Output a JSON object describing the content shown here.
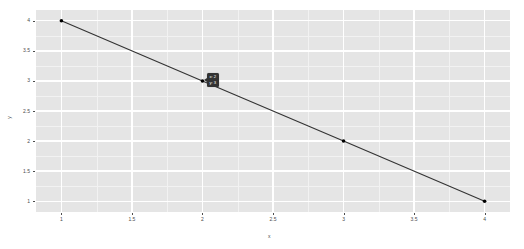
{
  "chart_data": {
    "type": "line",
    "title": "",
    "subtitle": "",
    "xlabel": "x",
    "ylabel": "y",
    "x": [
      1,
      2,
      3,
      4
    ],
    "values": [
      4,
      3,
      2,
      1
    ],
    "series": [
      {
        "name": "",
        "values": [
          4,
          3,
          2,
          1
        ]
      }
    ],
    "xlim": [
      0.82,
      4.18
    ],
    "ylim": [
      0.82,
      4.18
    ],
    "x_ticks": [
      1,
      1.5,
      2,
      2.5,
      3,
      3.5,
      4
    ],
    "x_tick_labels": [
      "1",
      "1.5",
      "2",
      "2.5",
      "3",
      "3.5",
      "4"
    ],
    "y_ticks": [
      1,
      1.5,
      2,
      2.5,
      3,
      3.5,
      4
    ],
    "y_tick_labels": [
      "1",
      "1.5",
      "2",
      "2.5",
      "3",
      "3.5",
      "4"
    ],
    "x_minor_ticks": [
      1.25,
      1.75,
      2.25,
      2.75,
      3.25,
      3.75
    ],
    "y_minor_ticks": [
      1.25,
      1.75,
      2.25,
      2.75,
      3.25,
      3.75
    ],
    "grid": true,
    "legend": false,
    "legend_position": "none",
    "line_color": "#333333",
    "point_color": "#000000",
    "panel_background": "#e5e5e5",
    "grid_major_color": "#ffffff",
    "grid_minor_color": "#f2f2f2",
    "plot_background": "#ffffff",
    "annotations": [
      {
        "name": "hover-tooltip",
        "at_x": 2,
        "at_y": 3,
        "lines": [
          "x: 2",
          "y: 3"
        ],
        "background": "#333333",
        "text_color": "#ffffff"
      }
    ]
  },
  "tooltip": {
    "line1": "x: 2",
    "line2": "y: 3"
  },
  "axes": {
    "x_title": "x",
    "y_title": "y"
  }
}
